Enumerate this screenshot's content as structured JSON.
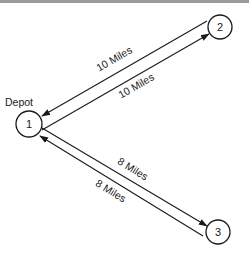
{
  "diagram": {
    "depot_label": "Depot",
    "nodes": [
      {
        "id": "1",
        "label": "1",
        "cx": 29,
        "cy": 124,
        "r": 13
      },
      {
        "id": "2",
        "label": "2",
        "cx": 220,
        "cy": 27,
        "r": 12
      },
      {
        "id": "3",
        "label": "3",
        "cx": 218,
        "cy": 232,
        "r": 12
      }
    ],
    "edges": [
      {
        "from": "2",
        "to": "1",
        "label": "10 Miles"
      },
      {
        "from": "1",
        "to": "2",
        "label": "10 Miles"
      },
      {
        "from": "3",
        "to": "1",
        "label": "8 Miles"
      },
      {
        "from": "1",
        "to": "3",
        "label": "8 Miles"
      }
    ]
  }
}
